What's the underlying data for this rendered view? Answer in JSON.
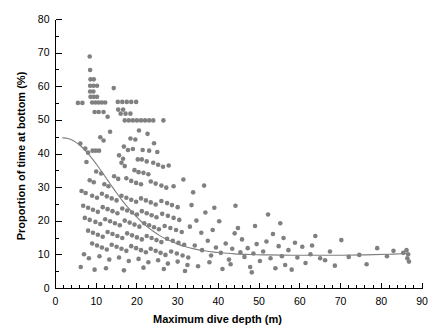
{
  "chart_data": {
    "type": "scatter",
    "title": "",
    "xlabel": "Maximum dive depth (m)",
    "ylabel": "Proportion of time at bottom (%)",
    "xlim": [
      0,
      90
    ],
    "ylim": [
      0,
      80
    ],
    "xticks": [
      0,
      10,
      20,
      30,
      40,
      50,
      60,
      70,
      80,
      90
    ],
    "yticks": [
      0,
      10,
      20,
      30,
      40,
      50,
      60,
      70,
      80
    ],
    "x_minor_tick_step": 2,
    "y_minor_tick_step": 5,
    "grid": false,
    "legend": null,
    "marker_color": "#808080",
    "marker_size_px": 4.6,
    "curve_color": "#808080",
    "series": [
      {
        "name": "Dives",
        "marker": "circle",
        "points": [
          [
            5.5,
            55.2
          ],
          [
            6.6,
            55.2
          ],
          [
            8.4,
            69.0
          ],
          [
            8.5,
            65.0
          ],
          [
            8.6,
            62.2
          ],
          [
            9.4,
            62.2
          ],
          [
            8.5,
            60.3
          ],
          [
            9.3,
            60.3
          ],
          [
            10.2,
            60.3
          ],
          [
            8.5,
            58.6
          ],
          [
            9.3,
            58.6
          ],
          [
            8.6,
            57.0
          ],
          [
            9.4,
            57.0
          ],
          [
            10.2,
            57.0
          ],
          [
            9.0,
            55.3
          ],
          [
            9.8,
            55.3
          ],
          [
            10.6,
            55.3
          ],
          [
            11.4,
            55.3
          ],
          [
            12.2,
            55.3
          ],
          [
            14.3,
            59.6
          ],
          [
            15.3,
            55.5
          ],
          [
            16.4,
            55.5
          ],
          [
            17.5,
            55.5
          ],
          [
            18.6,
            55.5
          ],
          [
            19.8,
            55.5
          ],
          [
            15.4,
            53.2
          ],
          [
            16.6,
            53.2
          ],
          [
            9.6,
            52.5
          ],
          [
            10.6,
            52.5
          ],
          [
            11.8,
            52.5
          ],
          [
            12.8,
            51.1
          ],
          [
            16.0,
            52.0
          ],
          [
            17.2,
            52.0
          ],
          [
            18.4,
            52.0
          ],
          [
            17.0,
            50.0
          ],
          [
            18.0,
            50.0
          ],
          [
            19.0,
            50.0
          ],
          [
            20.0,
            50.0
          ],
          [
            21.0,
            50.0
          ],
          [
            22.0,
            50.0
          ],
          [
            23.0,
            50.0
          ],
          [
            24.0,
            50.0
          ],
          [
            26.5,
            50.0
          ],
          [
            13.4,
            46.6
          ],
          [
            11.0,
            45.0
          ],
          [
            11.8,
            44.0
          ],
          [
            20.5,
            47.0
          ],
          [
            22.6,
            46.0
          ],
          [
            18.4,
            44.6
          ],
          [
            19.6,
            44.3
          ],
          [
            24.2,
            43.2
          ],
          [
            6.1,
            43.1
          ],
          [
            7.3,
            41.6
          ],
          [
            8.0,
            40.4
          ],
          [
            9.1,
            41.0
          ],
          [
            9.9,
            41.0
          ],
          [
            10.7,
            41.0
          ],
          [
            7.6,
            37.6
          ],
          [
            16.8,
            42.2
          ],
          [
            17.8,
            41.2
          ],
          [
            19.0,
            41.5
          ],
          [
            21.4,
            41.2
          ],
          [
            23.0,
            41.0
          ],
          [
            25.0,
            40.6
          ],
          [
            15.6,
            39.6
          ],
          [
            16.6,
            38.6
          ],
          [
            16.2,
            37.4
          ],
          [
            17.0,
            36.4
          ],
          [
            20.2,
            38.4
          ],
          [
            21.2,
            38.4
          ],
          [
            22.4,
            37.8
          ],
          [
            24.0,
            37.4
          ],
          [
            25.2,
            36.8
          ],
          [
            26.4,
            36.2
          ],
          [
            27.8,
            36.6
          ],
          [
            19.4,
            35.2
          ],
          [
            20.4,
            34.6
          ],
          [
            21.6,
            34.4
          ],
          [
            22.8,
            34.0
          ],
          [
            10.0,
            34.8
          ],
          [
            11.2,
            34.2
          ],
          [
            14.4,
            33.4
          ],
          [
            15.4,
            32.6
          ],
          [
            8.4,
            32.2
          ],
          [
            9.4,
            31.6
          ],
          [
            12.0,
            31.0
          ],
          [
            13.0,
            30.4
          ],
          [
            17.4,
            32.8
          ],
          [
            18.6,
            32.0
          ],
          [
            19.8,
            31.4
          ],
          [
            21.0,
            31.0
          ],
          [
            23.4,
            31.8
          ],
          [
            24.6,
            31.2
          ],
          [
            26.0,
            30.6
          ],
          [
            27.2,
            30.0
          ],
          [
            29.0,
            30.4
          ],
          [
            31.4,
            32.4
          ],
          [
            33.8,
            28.6
          ],
          [
            36.5,
            30.6
          ],
          [
            6.4,
            29.0
          ],
          [
            7.4,
            28.4
          ],
          [
            9.0,
            27.6
          ],
          [
            10.2,
            27.0
          ],
          [
            11.4,
            28.2
          ],
          [
            12.6,
            27.4
          ],
          [
            13.8,
            26.8
          ],
          [
            15.0,
            26.2
          ],
          [
            16.2,
            27.6
          ],
          [
            17.4,
            27.0
          ],
          [
            18.6,
            26.4
          ],
          [
            19.8,
            25.8
          ],
          [
            21.0,
            26.8
          ],
          [
            22.2,
            26.2
          ],
          [
            23.4,
            25.6
          ],
          [
            24.6,
            25.0
          ],
          [
            26.0,
            26.0
          ],
          [
            27.4,
            25.4
          ],
          [
            28.6,
            24.8
          ],
          [
            30.0,
            24.2
          ],
          [
            6.8,
            24.6
          ],
          [
            8.0,
            24.0
          ],
          [
            9.2,
            23.4
          ],
          [
            10.4,
            22.8
          ],
          [
            11.6,
            24.2
          ],
          [
            12.8,
            23.6
          ],
          [
            14.0,
            23.0
          ],
          [
            15.2,
            22.4
          ],
          [
            16.4,
            23.8
          ],
          [
            17.6,
            23.2
          ],
          [
            18.8,
            22.6
          ],
          [
            20.0,
            22.0
          ],
          [
            21.2,
            23.0
          ],
          [
            22.4,
            22.4
          ],
          [
            23.6,
            21.8
          ],
          [
            24.8,
            21.2
          ],
          [
            26.2,
            22.2
          ],
          [
            27.6,
            21.6
          ],
          [
            29.0,
            21.0
          ],
          [
            30.4,
            20.4
          ],
          [
            7.2,
            21.0
          ],
          [
            8.4,
            20.4
          ],
          [
            9.8,
            19.8
          ],
          [
            11.0,
            19.2
          ],
          [
            12.2,
            20.6
          ],
          [
            13.4,
            20.0
          ],
          [
            14.6,
            19.4
          ],
          [
            15.8,
            18.8
          ],
          [
            17.0,
            20.2
          ],
          [
            18.2,
            19.6
          ],
          [
            19.4,
            19.0
          ],
          [
            20.6,
            18.4
          ],
          [
            21.8,
            19.4
          ],
          [
            23.0,
            18.8
          ],
          [
            24.2,
            18.2
          ],
          [
            25.4,
            17.6
          ],
          [
            26.8,
            18.6
          ],
          [
            28.2,
            18.0
          ],
          [
            29.6,
            17.4
          ],
          [
            31.0,
            16.8
          ],
          [
            8.0,
            17.2
          ],
          [
            9.2,
            16.6
          ],
          [
            10.4,
            16.0
          ],
          [
            11.6,
            15.4
          ],
          [
            12.8,
            16.8
          ],
          [
            14.0,
            16.2
          ],
          [
            15.2,
            15.6
          ],
          [
            16.4,
            15.0
          ],
          [
            17.6,
            16.4
          ],
          [
            18.8,
            15.8
          ],
          [
            20.0,
            15.2
          ],
          [
            21.2,
            14.6
          ],
          [
            22.4,
            15.6
          ],
          [
            23.6,
            15.0
          ],
          [
            24.8,
            14.4
          ],
          [
            26.0,
            13.8
          ],
          [
            27.4,
            14.8
          ],
          [
            28.8,
            14.2
          ],
          [
            30.2,
            13.6
          ],
          [
            31.6,
            13.0
          ],
          [
            9.0,
            13.4
          ],
          [
            10.2,
            12.8
          ],
          [
            11.4,
            12.2
          ],
          [
            12.6,
            11.6
          ],
          [
            13.8,
            13.0
          ],
          [
            15.0,
            12.4
          ],
          [
            16.2,
            11.8
          ],
          [
            17.4,
            11.2
          ],
          [
            18.6,
            12.6
          ],
          [
            19.8,
            12.0
          ],
          [
            21.0,
            11.4
          ],
          [
            22.2,
            10.8
          ],
          [
            23.4,
            11.8
          ],
          [
            24.6,
            11.2
          ],
          [
            25.8,
            10.6
          ],
          [
            27.0,
            10.0
          ],
          [
            28.4,
            11.0
          ],
          [
            29.8,
            10.4
          ],
          [
            31.2,
            9.8
          ],
          [
            32.6,
            9.2
          ],
          [
            7.0,
            10.2
          ],
          [
            8.2,
            9.0
          ],
          [
            10.8,
            9.6
          ],
          [
            13.2,
            8.6
          ],
          [
            15.6,
            9.2
          ],
          [
            18.0,
            8.2
          ],
          [
            20.4,
            8.8
          ],
          [
            22.8,
            7.8
          ],
          [
            25.2,
            8.4
          ],
          [
            27.6,
            7.4
          ],
          [
            30.0,
            8.0
          ],
          [
            32.4,
            7.0
          ],
          [
            6.2,
            6.4
          ],
          [
            9.6,
            5.6
          ],
          [
            12.4,
            6.0
          ],
          [
            16.8,
            5.4
          ],
          [
            21.6,
            6.2
          ],
          [
            26.6,
            5.8
          ],
          [
            31.8,
            5.2
          ],
          [
            33.4,
            24.8
          ],
          [
            34.6,
            20.2
          ],
          [
            35.8,
            16.6
          ],
          [
            34.2,
            12.8
          ],
          [
            36.0,
            11.4
          ],
          [
            37.4,
            14.2
          ],
          [
            33.0,
            18.4
          ],
          [
            36.8,
            22.6
          ],
          [
            38.2,
            9.8
          ],
          [
            39.4,
            12.2
          ],
          [
            38.6,
            17.4
          ],
          [
            40.2,
            20.0
          ],
          [
            40.6,
            10.6
          ],
          [
            41.8,
            13.4
          ],
          [
            42.6,
            8.6
          ],
          [
            43.4,
            11.8
          ],
          [
            44.2,
            24.6
          ],
          [
            44.8,
            18.0
          ],
          [
            45.4,
            10.8
          ],
          [
            45.8,
            14.6
          ],
          [
            46.4,
            9.4
          ],
          [
            47.2,
            12.0
          ],
          [
            43.0,
            7.2
          ],
          [
            47.8,
            6.4
          ],
          [
            48.6,
            10.4
          ],
          [
            49.4,
            13.2
          ],
          [
            50.2,
            8.2
          ],
          [
            51.0,
            11.0
          ],
          [
            52.2,
            22.0
          ],
          [
            52.8,
            9.0
          ],
          [
            53.4,
            16.2
          ],
          [
            54.0,
            6.0
          ],
          [
            54.8,
            12.6
          ],
          [
            55.6,
            9.6
          ],
          [
            56.4,
            7.0
          ],
          [
            57.2,
            11.4
          ],
          [
            58.0,
            5.6
          ],
          [
            55.2,
            19.4
          ],
          [
            49.0,
            18.6
          ],
          [
            51.8,
            14.0
          ],
          [
            59.4,
            9.2
          ],
          [
            60.6,
            12.4
          ],
          [
            61.4,
            7.6
          ],
          [
            62.6,
            10.2
          ],
          [
            63.8,
            15.6
          ],
          [
            65.0,
            9.0
          ],
          [
            67.4,
            11.0
          ],
          [
            68.6,
            6.8
          ],
          [
            70.2,
            14.4
          ],
          [
            72.0,
            9.4
          ],
          [
            74.6,
            10.0
          ],
          [
            76.4,
            7.2
          ],
          [
            79.0,
            12.0
          ],
          [
            81.4,
            9.6
          ],
          [
            83.0,
            11.2
          ],
          [
            86.2,
            11.4
          ],
          [
            86.6,
            10.2
          ],
          [
            86.4,
            9.0
          ],
          [
            86.8,
            8.0
          ],
          [
            85.4,
            10.6
          ],
          [
            41.0,
            5.8
          ],
          [
            48.2,
            4.8
          ],
          [
            56.0,
            15.0
          ],
          [
            44.0,
            16.4
          ],
          [
            39.0,
            24.0
          ],
          [
            37.8,
            7.8
          ],
          [
            35.0,
            6.6
          ],
          [
            63.0,
            12.8
          ],
          [
            58.8,
            13.6
          ],
          [
            66.2,
            8.4
          ]
        ]
      }
    ],
    "fit_curve": {
      "name": "Fitted exponential decay",
      "description": "Smooth decline from ~45% near 2 m to ~10% asymptote beyond 40 m",
      "points": [
        [
          1.7,
          44.8
        ],
        [
          3.0,
          44.6
        ],
        [
          4.5,
          43.9
        ],
        [
          6.0,
          42.6
        ],
        [
          7.5,
          40.8
        ],
        [
          9.0,
          38.6
        ],
        [
          10.5,
          36.2
        ],
        [
          12.0,
          33.6
        ],
        [
          13.5,
          31.0
        ],
        [
          15.0,
          28.4
        ],
        [
          16.5,
          26.0
        ],
        [
          18.0,
          23.8
        ],
        [
          19.5,
          21.8
        ],
        [
          21.0,
          20.0
        ],
        [
          22.5,
          18.4
        ],
        [
          24.0,
          17.0
        ],
        [
          25.5,
          15.8
        ],
        [
          27.0,
          14.8
        ],
        [
          28.5,
          14.0
        ],
        [
          30.0,
          13.2
        ],
        [
          32.0,
          12.4
        ],
        [
          34.0,
          11.8
        ],
        [
          36.0,
          11.3
        ],
        [
          38.0,
          11.0
        ],
        [
          40.0,
          10.7
        ],
        [
          44.0,
          10.3
        ],
        [
          48.0,
          10.1
        ],
        [
          52.0,
          10.0
        ],
        [
          58.0,
          9.9
        ],
        [
          64.0,
          9.9
        ],
        [
          70.0,
          9.9
        ],
        [
          76.0,
          10.0
        ],
        [
          82.0,
          10.2
        ],
        [
          86.5,
          10.4
        ]
      ]
    }
  }
}
